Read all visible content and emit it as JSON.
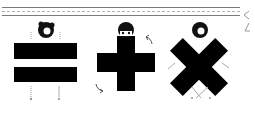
{
  "figure": {
    "symbols": [
      {
        "name": "equals",
        "glyph": "=",
        "color": "#000000"
      },
      {
        "name": "plus",
        "glyph": "+",
        "color": "#000000"
      },
      {
        "name": "multiply",
        "glyph": "×",
        "color": "#000000"
      }
    ],
    "characters": 3,
    "header_lines": [
      "solid",
      "dashed",
      "solid"
    ],
    "edge_glyphs": [
      "<",
      "/"
    ]
  }
}
